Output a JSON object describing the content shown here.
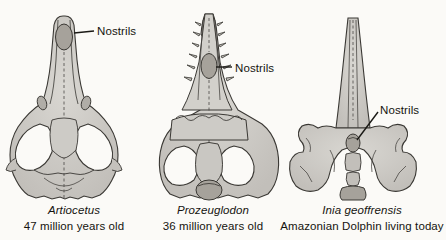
{
  "figure": {
    "background_color": "#fbfaf7",
    "bone_fill": "#c9c7c2",
    "bone_fill_light": "#d7d5d0",
    "bone_shadow": "#b4b1ab",
    "nostril_fill": "#a6a29b",
    "outline_color": "#3a3834",
    "text_color": "#15140f"
  },
  "labels": {
    "nostrils_1": "Nostrils",
    "nostrils_2": "Nostrils",
    "nostrils_3": "Nostrils"
  },
  "specimens": [
    {
      "id": "artiocetus",
      "sci_name": "Artiocetus",
      "age": "47 million years old",
      "nostril_position": "tip of snout"
    },
    {
      "id": "prozeuglodon",
      "sci_name": "Prozeuglodon",
      "age": "36 million years old",
      "nostril_position": "mid rostrum"
    },
    {
      "id": "inia-geoffrensis",
      "sci_name": "Inia geoffrensis",
      "age": "Amazonian Dolphin living today",
      "nostril_position": "top of skull near braincase"
    }
  ]
}
